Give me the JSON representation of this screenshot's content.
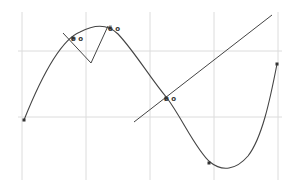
{
  "diagram": {
    "type": "function-plot-with-tangents",
    "colors": {
      "grid": "#dcdcdc",
      "curve": "#444444",
      "points": "#333333",
      "background": "#ffffff"
    },
    "grid": {
      "vertical_x": [
        22,
        86,
        150,
        214,
        278
      ],
      "horizontal_y": [
        51,
        117
      ],
      "top": 12,
      "bottom": 180,
      "left": 18,
      "right": 282
    },
    "curve": {
      "path": "M24,120 C40,80 60,40 80,32 C95,24 108,24 118,34 C135,52 150,78 167,98 C182,118 196,150 210,162 C222,172 236,170 248,156 C262,138 270,100 277,64"
    },
    "points": [
      {
        "x": 24,
        "y": 120,
        "label": ""
      },
      {
        "x": 73,
        "y": 38,
        "label": "ø o"
      },
      {
        "x": 110,
        "y": 28,
        "label": "ö o"
      },
      {
        "x": 166,
        "y": 98,
        "label": "ø o"
      },
      {
        "x": 209,
        "y": 163,
        "label": ""
      },
      {
        "x": 277,
        "y": 64,
        "label": ""
      }
    ],
    "lines": [
      {
        "name": "tangent-v-shape",
        "points": "63,33 91,63 108,26"
      },
      {
        "name": "secant-line",
        "points": "134,122 272,15"
      }
    ]
  }
}
